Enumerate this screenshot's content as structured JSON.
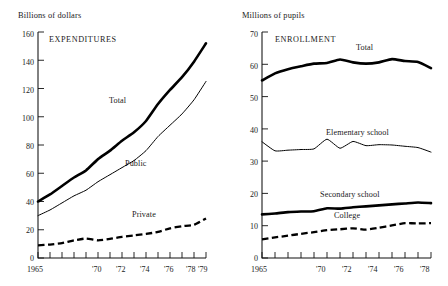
{
  "figure": {
    "background_color": "#ffffff",
    "ink_color": "#000000"
  },
  "panels": {
    "left": {
      "unit_label": "Billions of dollars",
      "title": "EXPENDITURES",
      "x_axis_first_label": "1965",
      "x_tick_labels": [
        "1965",
        "'70",
        "'72",
        "'74",
        "'76",
        "'78",
        "'79"
      ],
      "y_tick_labels": [
        "0",
        "20",
        "40",
        "60",
        "80",
        "100",
        "120",
        "140",
        "160"
      ],
      "series_labels": {
        "total": "Total",
        "public": "Public",
        "private": "Private"
      }
    },
    "right": {
      "unit_label": "Millions of pupils",
      "title": "ENROLLMENT",
      "x_axis_first_label": "1965",
      "x_tick_labels": [
        "1965",
        "'70",
        "'72",
        "'74",
        "'76",
        "'78"
      ],
      "y_tick_labels": [
        "0",
        "10",
        "20",
        "30",
        "40",
        "50",
        "60",
        "70"
      ],
      "series_labels": {
        "total": "Total",
        "elementary": "Elementary school",
        "secondary": "Secondary school",
        "college": "College"
      }
    }
  },
  "chart_data": [
    {
      "type": "line",
      "title": "EXPENDITURES",
      "xlabel": "",
      "ylabel": "Billions of dollars",
      "xlim": [
        1965,
        1979
      ],
      "ylim": [
        0,
        160
      ],
      "ytick_step": 20,
      "grid": false,
      "legend": "inline-annotations",
      "x": [
        1965,
        1966,
        1967,
        1968,
        1969,
        1970,
        1971,
        1972,
        1973,
        1974,
        1975,
        1976,
        1977,
        1978,
        1979
      ],
      "series": [
        {
          "name": "Total",
          "style": "thick-solid",
          "values": [
            40,
            45,
            51,
            57,
            62,
            70,
            76,
            83,
            89,
            97,
            109,
            119,
            128,
            139,
            152
          ]
        },
        {
          "name": "Public",
          "style": "thin-solid",
          "values": [
            30,
            34,
            39,
            44,
            48,
            54,
            59,
            64,
            69,
            76,
            86,
            94,
            102,
            112,
            125
          ]
        },
        {
          "name": "Private",
          "style": "dashed",
          "values": [
            9,
            9.5,
            10.5,
            12.5,
            13.8,
            12.5,
            13.5,
            15,
            16,
            17,
            18.5,
            21,
            22.5,
            23.5,
            28
          ]
        }
      ]
    },
    {
      "type": "line",
      "title": "ENROLLMENT",
      "xlabel": "",
      "ylabel": "Millions of pupils",
      "xlim": [
        1965,
        1978
      ],
      "ylim": [
        0,
        70
      ],
      "ytick_step": 10,
      "grid": false,
      "legend": "inline-annotations",
      "x": [
        1965,
        1966,
        1967,
        1968,
        1969,
        1970,
        1971,
        1972,
        1973,
        1974,
        1975,
        1976,
        1977,
        1978
      ],
      "series": [
        {
          "name": "Total",
          "style": "thick-solid",
          "values": [
            55.0,
            57.2,
            58.5,
            59.4,
            60.2,
            60.4,
            61.5,
            60.6,
            60.2,
            60.6,
            61.6,
            61.0,
            60.7,
            58.8
          ]
        },
        {
          "name": "Elementary school",
          "style": "thin-solid",
          "values": [
            36.0,
            33.2,
            33.4,
            33.6,
            33.8,
            36.8,
            34.0,
            36.1,
            34.8,
            35.1,
            35.0,
            34.6,
            34.2,
            32.8
          ]
        },
        {
          "name": "Secondary school",
          "style": "thick-solid",
          "values": [
            13.5,
            13.8,
            14.2,
            14.4,
            14.5,
            15.4,
            15.3,
            15.7,
            16.0,
            16.3,
            16.6,
            16.9,
            17.2,
            17.0
          ]
        },
        {
          "name": "College",
          "style": "dashed",
          "values": [
            5.8,
            6.4,
            6.9,
            7.5,
            8.0,
            8.6,
            8.9,
            9.2,
            8.8,
            9.4,
            10.1,
            10.8,
            10.7,
            10.8
          ]
        }
      ]
    }
  ]
}
